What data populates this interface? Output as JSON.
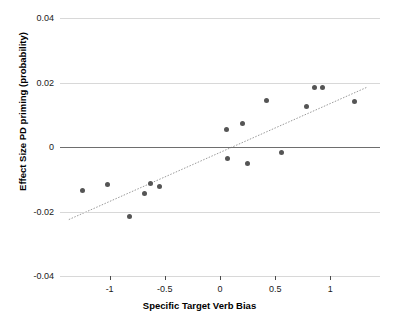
{
  "chart_data": {
    "type": "scatter",
    "title": "",
    "xlabel": "Specific Target Verb Bias",
    "ylabel": "Effect Size PD priming (probability)",
    "xlim": [
      -1.45,
      1.45
    ],
    "ylim": [
      -0.04,
      0.04
    ],
    "yticks": [
      0.04,
      0.02,
      0,
      -0.02,
      -0.04
    ],
    "ytick_labels": [
      "0.04",
      "0.02",
      "0",
      "-0.02",
      "-0.04"
    ],
    "xticks": [
      -1,
      -0.5,
      0,
      0.5,
      1
    ],
    "xtick_labels": [
      "-1",
      "-0.5",
      "0",
      "0.5",
      "1"
    ],
    "grid": "horizontal",
    "legend": "none",
    "points": [
      {
        "x": -1.25,
        "y": -0.0135
      },
      {
        "x": -1.02,
        "y": -0.0115
      },
      {
        "x": -0.82,
        "y": -0.0215
      },
      {
        "x": -0.68,
        "y": -0.0145
      },
      {
        "x": -0.63,
        "y": -0.0112
      },
      {
        "x": -0.55,
        "y": -0.0122
      },
      {
        "x": 0.06,
        "y": 0.0055
      },
      {
        "x": 0.07,
        "y": -0.0035
      },
      {
        "x": 0.2,
        "y": 0.0073
      },
      {
        "x": 0.25,
        "y": -0.0052
      },
      {
        "x": 0.42,
        "y": 0.0143
      },
      {
        "x": 0.56,
        "y": -0.0018
      },
      {
        "x": 0.78,
        "y": 0.0125
      },
      {
        "x": 0.86,
        "y": 0.0185
      },
      {
        "x": 0.93,
        "y": 0.0183
      },
      {
        "x": 1.22,
        "y": 0.0142
      }
    ],
    "trendline": {
      "x_start": -1.37,
      "y_start": -0.0225,
      "x_end": 1.33,
      "y_end": 0.0185,
      "color": "#9a9a9a",
      "style": "dotted"
    },
    "point_color": "#555555"
  }
}
